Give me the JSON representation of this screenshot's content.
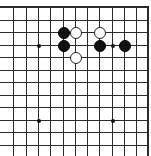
{
  "board": {
    "description": "Partial Go board (top-right corner region)",
    "columns_x": [
      13,
      26,
      38,
      50,
      63,
      75,
      87,
      99,
      112,
      124,
      136,
      148
    ],
    "rows_y": [
      7,
      20,
      32,
      45,
      57,
      70,
      82,
      95,
      107,
      120,
      132,
      145
    ],
    "edges": {
      "top": true,
      "right": true,
      "left": false,
      "bottom": false
    },
    "colors": {
      "line": "#2a2a2a",
      "background": "#ffffff",
      "black_stone": "#111111",
      "white_stone": "#ffffff"
    },
    "star_points": [
      {
        "col": 2,
        "row": 3
      },
      {
        "col": 8,
        "row": 3
      },
      {
        "col": 2,
        "row": 9
      },
      {
        "col": 8,
        "row": 9
      }
    ],
    "stones": [
      {
        "color": "black",
        "col": 4,
        "row": 2
      },
      {
        "color": "black",
        "col": 4,
        "row": 3
      },
      {
        "color": "black",
        "col": 7,
        "row": 3
      },
      {
        "color": "black",
        "col": 9,
        "row": 3
      },
      {
        "color": "white",
        "col": 5,
        "row": 2
      },
      {
        "color": "white",
        "col": 7,
        "row": 2
      },
      {
        "color": "white",
        "col": 5,
        "row": 4
      }
    ]
  }
}
